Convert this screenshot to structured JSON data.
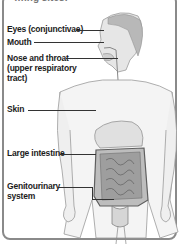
{
  "diagram": {
    "heading_partial": "…ing sites:",
    "labels": [
      {
        "id": "eyes",
        "text": "Eyes (conjunctivae)"
      },
      {
        "id": "mouth",
        "text": "Mouth"
      },
      {
        "id": "nose-throat",
        "lines": [
          "Nose and throat",
          "(upper respiratory",
          "tract)"
        ]
      },
      {
        "id": "skin",
        "text": "Skin"
      },
      {
        "id": "large-intestine",
        "text": "Large intestine"
      },
      {
        "id": "genitourinary",
        "lines": [
          "Genitourinary",
          "system"
        ]
      }
    ],
    "colors": {
      "line": "#333333",
      "label": "#1c1c1c",
      "border": "#8a8a8a",
      "figure": "#9a9a9a",
      "organ": "#6e6e6e"
    }
  }
}
